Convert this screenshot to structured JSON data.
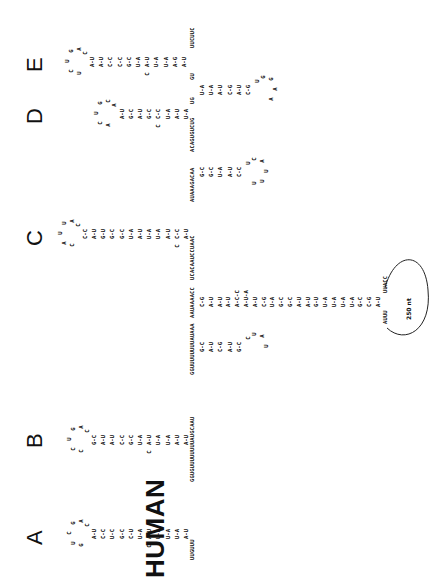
{
  "organism": "HUMAN",
  "hairpin_labels": [
    "A",
    "B",
    "C",
    "D",
    "E"
  ],
  "hairpins": [
    {
      "id": "A",
      "five_prime_linker": "UUGUUU",
      "stem_pairs": [
        "A-U",
        "U-A",
        "U-A",
        "U-A",
        "A-U",
        "U-A",
        "C-U",
        "G-C",
        "U-C",
        "C-C",
        "A-U"
      ],
      "bulge": "C",
      "loop": [
        "C",
        "A",
        "G",
        "C",
        "U",
        "G"
      ],
      "three_prime_linker": "GGUGUUUUUUUUAUGCAAU"
    },
    {
      "id": "B",
      "stem_pairs": [
        "A-U",
        "A-U",
        "U-A",
        "U-A",
        "A-U",
        "U-A",
        "G-C",
        "C-C",
        "A-U",
        "A-U",
        "G-C"
      ],
      "bulge": "C",
      "loop": [
        "C",
        "A",
        "G",
        "U",
        "C",
        "C"
      ],
      "side_stem_pairs": [
        "G-C",
        "A-U",
        "C-G",
        "A-U",
        "G-C"
      ],
      "side_loop": [
        "C",
        "U",
        "A",
        "U"
      ],
      "linker_1": "GGUUUUUUUUAUAAA",
      "linker_2": "AAUAAAACC"
    },
    {
      "id": "C",
      "stem_pairs": [
        "A-U",
        "C-C",
        "A-U",
        "U-A",
        "U-A",
        "A-U",
        "U-A",
        "G-C",
        "G-C",
        "G-U",
        "A-U",
        "C-C"
      ],
      "bulge": "C",
      "loop": [
        "C",
        "A",
        "U",
        "U",
        "A",
        "C"
      ],
      "linker": "UCACAAUCCUAAC"
    },
    {
      "id": "ext",
      "stem_pairs": [
        "C-G",
        "A-U",
        "A-U",
        "A-U",
        "A-C-C",
        "A-U-A",
        "A-U",
        "C-G",
        "U-A",
        "G-C",
        "G-C",
        "A-U",
        "A-U",
        "G-U",
        "U-A",
        "U-A",
        "U-A",
        "U-A",
        "G-C",
        "C-G",
        "A-U"
      ],
      "terminal_left": "AUUU",
      "terminal_right": "UUACC",
      "loop_note": "250 nt"
    },
    {
      "id": "D-side",
      "linker": "AUAAAGACAA",
      "stem_pairs": [
        "G-C",
        "G-C",
        "U-A",
        "A-U",
        "C-C"
      ],
      "loop": [
        "U",
        "C",
        "A",
        "U",
        "U",
        "U"
      ],
      "linker_2": "ACAGUGUCUG"
    },
    {
      "id": "D",
      "stem_pairs": [
        "U-A",
        "A-U",
        "U-A",
        "C-C",
        "G-C",
        "A-U",
        "G-C",
        "A-U"
      ],
      "bulge": "C",
      "loop": [
        "A",
        "C",
        "G",
        "U",
        "C",
        "A"
      ],
      "linker": "UG"
    },
    {
      "id": "E-side",
      "linker": "GU",
      "stem_pairs": [
        "U-A",
        "U-A",
        "A-U",
        "C-G",
        "A-U",
        "C-G"
      ],
      "loop": [
        "U",
        "G",
        "G",
        "A",
        "A"
      ]
    },
    {
      "id": "E",
      "stem_pairs": [
        "A-U",
        "A-G",
        "U-A",
        "U-A",
        "A-U",
        "U-A",
        "G-C",
        "C-C",
        "C-C",
        "A-U",
        "A-U"
      ],
      "bulge": "C",
      "loop": [
        "C",
        "A",
        "G",
        "U",
        "C",
        "U"
      ],
      "three_prime_end": "UUCUUC"
    }
  ]
}
